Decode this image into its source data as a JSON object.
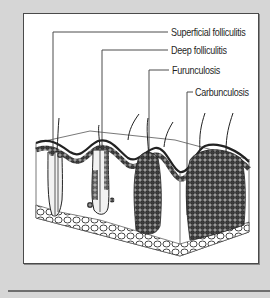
{
  "figure": {
    "type": "skin cross-section illustration",
    "labels": [
      {
        "id": "superficial",
        "text": "Superficial folliculitis"
      },
      {
        "id": "deep",
        "text": "Deep folliculitis"
      },
      {
        "id": "furunculosis",
        "text": "Furunculosis"
      },
      {
        "id": "carbunculosis",
        "text": "Carbunculosis"
      }
    ]
  },
  "colors": {
    "background": "#d6d6d6",
    "panel": "#ffffff",
    "border": "#4a4a4a",
    "line": "#4d4d4d"
  }
}
